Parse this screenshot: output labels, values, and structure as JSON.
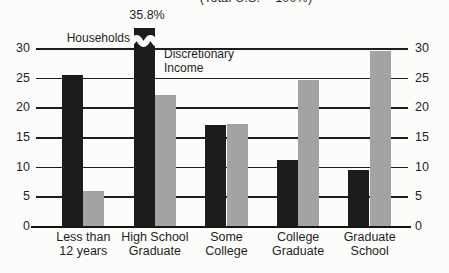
{
  "chart_data": {
    "type": "bar",
    "title": "(Total U.S. = 100%)",
    "categories": [
      "Less than\n12 years",
      "High School\nGraduate",
      "Some\nCollege",
      "College\nGraduate",
      "Graduate\nSchool"
    ],
    "series": [
      {
        "name": "Households",
        "color": "#1c1c1c",
        "values": [
          25.5,
          35.8,
          17.0,
          11.1,
          9.4
        ]
      },
      {
        "name": "Discretionary Income",
        "color": "#a3a3a3",
        "values": [
          5.9,
          22.0,
          17.2,
          24.6,
          29.5
        ]
      }
    ],
    "ylim": [
      0,
      30
    ],
    "yticks": [
      0,
      5,
      10,
      15,
      20,
      25,
      30
    ],
    "grid": true,
    "legend_position": "inline-annotations",
    "axis_label_sides": "both",
    "annotations": {
      "broken_bar_label": "35.8%",
      "households_label": "Households",
      "discretionary_label": "Discretionary\nIncome"
    }
  }
}
